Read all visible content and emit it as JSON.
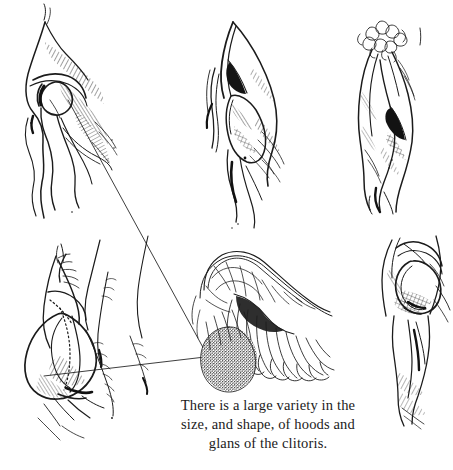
{
  "plate": {
    "kind": "pen-and-ink anatomical illustration plate",
    "background_color": "#ffffff",
    "ink_color": "#1b1b1b",
    "width": 453,
    "height": 470
  },
  "caption": {
    "text": "There is a large variety in the\nsize, and shape, of hoods and\nglans of the clitoris.",
    "lines": [
      "There is a large variety in the",
      "size, and shape, of hoods and",
      "glans of the clitoris."
    ],
    "align": "center",
    "color": "#1b1b1b"
  },
  "panels": [
    {
      "id": "panel-top-left",
      "label": "vulva three-quarter view with prominent clitoral hood",
      "row": "top",
      "column": "left",
      "features": [
        "clitoral hood",
        "glans",
        "labia",
        "dense diagonal hatching",
        "leader line origin"
      ]
    },
    {
      "id": "panel-top-center",
      "label": "vulva frontal view with narrow hood and dark vestibule",
      "row": "top",
      "column": "center",
      "features": [
        "pointed hood",
        "dark wedge shadow",
        "labia minora",
        "cross hatching"
      ]
    },
    {
      "id": "panel-top-right",
      "label": "vulva view with pubic hair curls and dark vestibule",
      "row": "top",
      "column": "right",
      "features": [
        "pubic hair curls",
        "hood",
        "dark vestibule",
        "stipple shading"
      ]
    },
    {
      "id": "panel-bottom-left",
      "label": "vulva side view with large rounded hood and hair strands",
      "row": "bottom",
      "column": "left",
      "features": [
        "rounded hood",
        "hair strands",
        "hatched shadow",
        "leader line origin"
      ]
    },
    {
      "id": "panel-center-detail",
      "label": "magnified detail of clitoral glans and hood with stippled glans",
      "row": "bottom",
      "column": "center",
      "features": [
        "stippled glans",
        "retracted hood",
        "frond-like folds",
        "fine outline work"
      ]
    },
    {
      "id": "panel-bottom-right",
      "label": "vulva view with circular hood opening and cross hatching",
      "row": "bottom",
      "column": "right",
      "features": [
        "circular hood ring",
        "cross hatching",
        "shaft",
        "vertical hatching"
      ]
    }
  ],
  "leader_lines": [
    {
      "id": "leader-upper",
      "from_panel": "panel-top-left",
      "to_panel": "panel-center-detail",
      "description": "long diagonal line from upper-left glans down to magnified glans"
    },
    {
      "id": "leader-lower",
      "from_panel": "panel-bottom-left",
      "to_panel": "panel-center-detail",
      "description": "near-horizontal line from lower-left hood to magnified glans"
    }
  ]
}
